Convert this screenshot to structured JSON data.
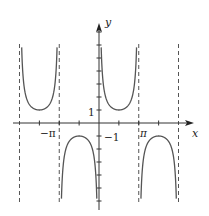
{
  "chart_data": {
    "type": "line",
    "title": "",
    "function": "y = csc(x)",
    "xlabel": "x",
    "ylabel": "y",
    "x_tick_labels": [
      {
        "value": -3.14159,
        "label": "−π"
      },
      {
        "value": 3.14159,
        "label": "π"
      }
    ],
    "y_tick_labels": [
      {
        "value": 1,
        "label": "1"
      },
      {
        "value": -1,
        "label": "−1"
      }
    ],
    "x_ticks_step": "π/2",
    "y_ticks_step": 1,
    "xlim": [
      -6.6,
      7.4
    ],
    "ylim": [
      -6.5,
      7.5
    ],
    "asymptotes": [
      -6.28319,
      -3.14159,
      0,
      3.14159,
      6.28319
    ],
    "asymptote_style": "dashed",
    "grid": false,
    "series": [
      {
        "name": "csc(x) on (-2π,-π)",
        "x_range": [
          -6.28319,
          -3.14159
        ],
        "extremum": {
          "x": -4.71239,
          "y": 1
        }
      },
      {
        "name": "csc(x) on (-π,0)",
        "x_range": [
          -3.14159,
          0
        ],
        "extremum": {
          "x": -1.5708,
          "y": -1
        }
      },
      {
        "name": "csc(x) on (0,π)",
        "x_range": [
          0,
          3.14159
        ],
        "extremum": {
          "x": 1.5708,
          "y": 1
        }
      },
      {
        "name": "csc(x) on (π,2π)",
        "x_range": [
          3.14159,
          6.28319
        ],
        "extremum": {
          "x": 4.71239,
          "y": -1
        }
      }
    ]
  },
  "axes": {
    "x_label": "x",
    "y_label": "y",
    "tick_neg_pi": "−π",
    "tick_pi": "π",
    "tick_one": "1",
    "tick_neg_one": "−1"
  },
  "colors": {
    "curve": "#555555",
    "axis": "#333333",
    "asymptote": "#555555"
  }
}
